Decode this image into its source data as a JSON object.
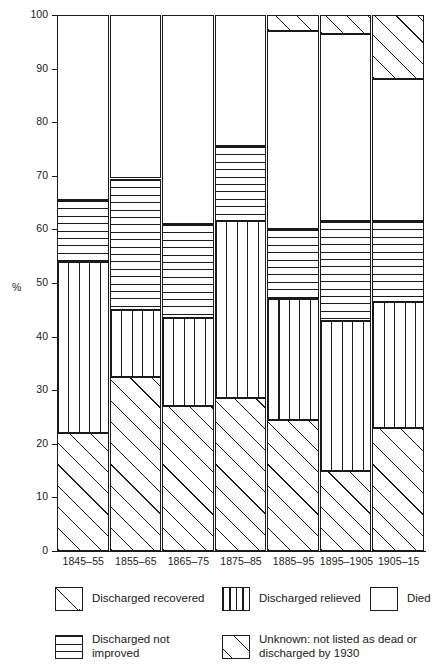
{
  "chart_data": {
    "type": "bar",
    "subtype": "stacked-percentage",
    "title": "",
    "xlabel": "",
    "ylabel": "%",
    "ylim": [
      0,
      100
    ],
    "yticks": [
      0,
      10,
      20,
      30,
      40,
      50,
      60,
      70,
      80,
      90,
      100
    ],
    "grid": false,
    "legend_position": "bottom",
    "units": "percent",
    "categories": [
      "1845–55",
      "1855–65",
      "1865–75",
      "1875–85",
      "1885–95",
      "1895–1905",
      "1905–15"
    ],
    "series": [
      {
        "name": "Discharged recovered",
        "pattern": "diagonal-hatch",
        "values": [
          22,
          32.5,
          27,
          28.5,
          24.5,
          15,
          23
        ]
      },
      {
        "name": "Discharged relieved",
        "pattern": "vertical-lines",
        "values": [
          32,
          12.5,
          16.5,
          33,
          22.5,
          28,
          23.5
        ]
      },
      {
        "name": "Discharged not improved",
        "pattern": "horizontal-lines",
        "values": [
          11.5,
          24.5,
          17.5,
          14,
          13,
          18.5,
          15
        ]
      },
      {
        "name": "Died",
        "pattern": "white",
        "values": [
          34.5,
          30.5,
          39,
          24.5,
          37,
          35,
          26.5
        ]
      },
      {
        "name": "Unknown: not listed as dead or discharged by 1930",
        "pattern": "diagonal-hatch-sparse",
        "values": [
          0,
          0,
          0,
          0,
          3,
          3.5,
          12
        ]
      }
    ]
  },
  "axes": {
    "y_axis_title": "%",
    "y_tick_labels": [
      "100",
      "90",
      "80",
      "70",
      "60",
      "50",
      "40",
      "30",
      "20",
      "10",
      "0"
    ],
    "x_tick_labels": [
      "1845–55",
      "1855–65",
      "1865–75",
      "1875–85",
      "1885–95",
      "1895–1905",
      "1905–15"
    ]
  },
  "legend": {
    "items": [
      {
        "label": "Discharged recovered",
        "pattern": "diagonal-hatch"
      },
      {
        "label": "Discharged relieved",
        "pattern": "vertical-lines"
      },
      {
        "label": "Died",
        "pattern": "white"
      },
      {
        "label": "Discharged not\nimproved",
        "pattern": "horizontal-lines"
      },
      {
        "label": "Unknown: not listed as dead or\ndischarged by 1930",
        "pattern": "diagonal-hatch-sparse"
      }
    ]
  },
  "colors": {
    "ink": "#1a1a1a",
    "background": "#ffffff"
  }
}
